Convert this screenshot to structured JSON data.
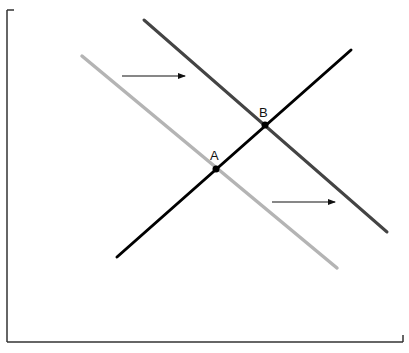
{
  "diagram": {
    "type": "supply-demand-shift",
    "canvas": {
      "width": 409,
      "height": 353,
      "background": "#ffffff"
    },
    "axes": {
      "color": "#333333",
      "vertical": {
        "x": 7,
        "y1": 10,
        "y2": 342,
        "top_tick_x2": 14
      },
      "horizontal": {
        "y": 342,
        "x1": 7,
        "x2": 403,
        "right_tick_y1": 335
      }
    },
    "lines": [
      {
        "id": "demand-original",
        "color": "#b4b4b4",
        "width": 3.5,
        "x1": 82,
        "y1": 56,
        "x2": 337,
        "y2": 268
      },
      {
        "id": "demand-shifted",
        "color": "#444444",
        "width": 3,
        "x1": 144,
        "y1": 20,
        "x2": 387,
        "y2": 232
      },
      {
        "id": "supply",
        "color": "#000000",
        "width": 3,
        "x1": 117,
        "y1": 257,
        "x2": 351,
        "y2": 50
      }
    ],
    "arrows": [
      {
        "id": "shift-arrow-upper",
        "color": "#111111",
        "x1": 122,
        "y1": 76,
        "x2": 185,
        "y2": 76
      },
      {
        "id": "shift-arrow-lower",
        "color": "#111111",
        "x1": 272,
        "y1": 202,
        "x2": 335,
        "y2": 202
      }
    ],
    "points": [
      {
        "label": "A",
        "x": 216,
        "y": 169,
        "label_x": 210,
        "label_y": 160
      },
      {
        "label": "B",
        "x": 265,
        "y": 125,
        "label_x": 259,
        "label_y": 117
      }
    ]
  }
}
